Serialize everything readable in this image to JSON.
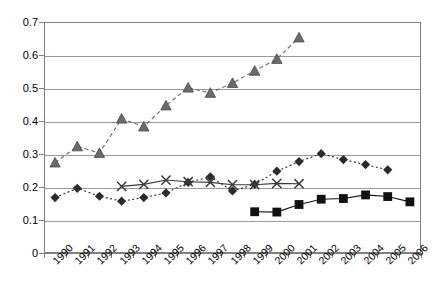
{
  "chart_data": {
    "type": "line",
    "title": "",
    "subtitle": "",
    "xlabel": "",
    "ylabel": "",
    "categories": [
      "1990",
      "1991",
      "1992",
      "1993",
      "1994",
      "1995",
      "1996",
      "1997",
      "1998",
      "1999",
      "2000",
      "2001",
      "2002",
      "2003",
      "2004",
      "2005",
      "2006"
    ],
    "ylim": [
      0,
      0.7
    ],
    "xlim_categories": [
      0,
      16
    ],
    "y_ticks": [
      "0",
      "0.1",
      "0.2",
      "0.3",
      "0.4",
      "0.5",
      "0.6",
      "0.7"
    ],
    "y_tick_values": [
      0,
      0.1,
      0.2,
      0.3,
      0.4,
      0.5,
      0.6,
      0.7
    ],
    "grid": "horizontal",
    "legend": "none",
    "series": [
      {
        "name": "series-triangle",
        "marker": "triangle",
        "line_style": "dashed",
        "color": "#6b6b6b",
        "values": [
          0.274,
          0.323,
          0.303,
          0.407,
          0.383,
          0.447,
          0.501,
          0.485,
          0.515,
          0.552,
          0.588,
          0.653,
          null,
          null,
          null,
          null,
          null
        ]
      },
      {
        "name": "series-diamond",
        "marker": "diamond",
        "line_style": "dotted",
        "color": "#2b2b2b",
        "values": [
          0.168,
          0.196,
          0.172,
          0.157,
          0.168,
          0.182,
          0.214,
          0.231,
          0.188,
          0.208,
          0.248,
          0.277,
          0.301,
          0.283,
          0.268,
          0.252,
          null
        ]
      },
      {
        "name": "series-cross",
        "marker": "cross",
        "line_style": "solid",
        "color": "#3a3a3a",
        "values": [
          null,
          null,
          null,
          0.202,
          0.208,
          0.221,
          0.216,
          0.214,
          0.207,
          0.207,
          0.211,
          0.21,
          null,
          null,
          null,
          null,
          null
        ]
      },
      {
        "name": "series-square",
        "marker": "square",
        "line_style": "solid",
        "color": "#111111",
        "values": [
          null,
          null,
          null,
          null,
          null,
          null,
          null,
          null,
          null,
          0.125,
          0.124,
          0.147,
          0.163,
          0.165,
          0.176,
          0.171,
          0.155
        ]
      }
    ]
  },
  "colors": {
    "plot_border": "#808080",
    "gridline": "#9a9a9a",
    "background": "#ffffff",
    "axis_text": "#000000"
  }
}
